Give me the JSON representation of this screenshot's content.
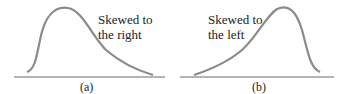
{
  "panels": [
    {
      "id": "a",
      "caption": "(a)",
      "label_line1": "Skewed to",
      "label_line2": "the right",
      "skew": "right"
    },
    {
      "id": "b",
      "caption": "(b)",
      "label_line1": "Skewed to",
      "label_line2": "the left",
      "skew": "left"
    }
  ],
  "colors": {
    "curve": "#8a8a8a",
    "axis": "#6a6a6a",
    "text": "#222222"
  }
}
